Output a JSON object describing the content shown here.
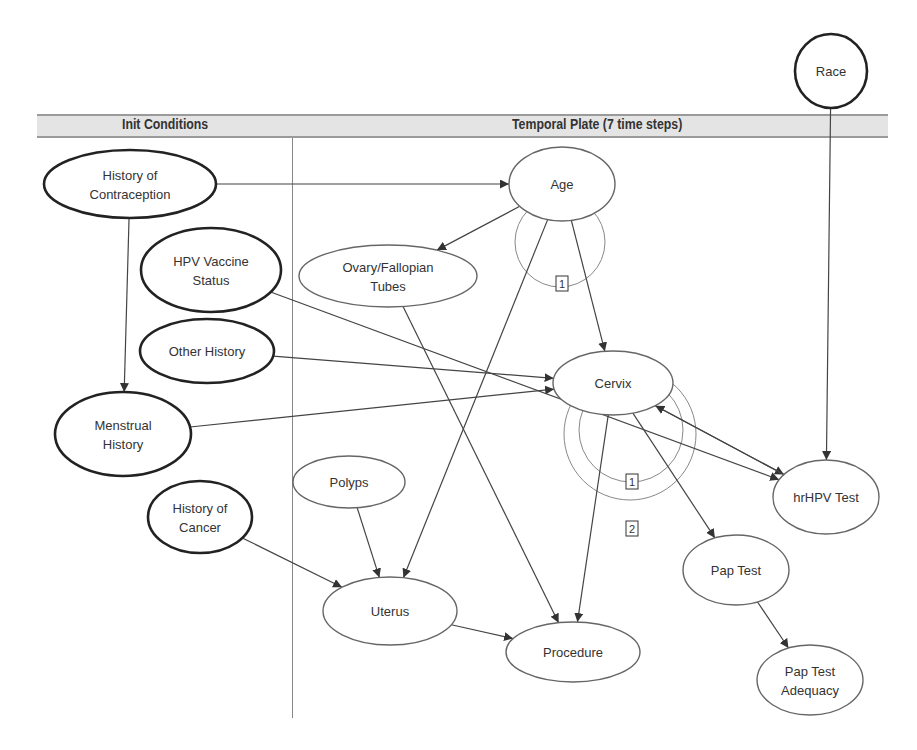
{
  "plate": {
    "init_label": "Init Conditions",
    "temporal_label": "Temporal Plate (7 time steps)"
  },
  "colors": {
    "edge": "#444444",
    "loop_edge": "#888888",
    "node_stroke_init": "#222222",
    "node_stroke_temporal": "#666666",
    "header_fill": "#e4e4e4"
  },
  "nodes": [
    {
      "id": "race",
      "lines": [
        "Race"
      ],
      "cx": 831,
      "cy": 71,
      "rx": 36,
      "ry": 37,
      "bold": true
    },
    {
      "id": "history-of-contraception",
      "lines": [
        "History of",
        "Contraception"
      ],
      "cx": 130,
      "cy": 184,
      "rx": 86,
      "ry": 34,
      "bold": true
    },
    {
      "id": "hpv-vaccine-status",
      "lines": [
        "HPV Vaccine",
        "Status"
      ],
      "cx": 211,
      "cy": 270,
      "rx": 70,
      "ry": 42,
      "bold": true
    },
    {
      "id": "other-history",
      "lines": [
        "Other History"
      ],
      "cx": 207,
      "cy": 351,
      "rx": 67,
      "ry": 32,
      "bold": true
    },
    {
      "id": "menstrual-history",
      "lines": [
        "Menstrual",
        "History"
      ],
      "cx": 123,
      "cy": 434,
      "rx": 68,
      "ry": 42,
      "bold": true
    },
    {
      "id": "history-of-cancer",
      "lines": [
        "History of",
        "Cancer"
      ],
      "cx": 200,
      "cy": 517,
      "rx": 52,
      "ry": 36,
      "bold": true
    },
    {
      "id": "age",
      "lines": [
        "Age"
      ],
      "cx": 562,
      "cy": 184,
      "rx": 53,
      "ry": 37,
      "bold": false
    },
    {
      "id": "ovary-fallopian-tubes",
      "lines": [
        "Ovary/Fallopian",
        "Tubes"
      ],
      "cx": 388,
      "cy": 276,
      "rx": 89,
      "ry": 31,
      "bold": false
    },
    {
      "id": "cervix",
      "lines": [
        "Cervix"
      ],
      "cx": 613,
      "cy": 383,
      "rx": 60,
      "ry": 32,
      "bold": false
    },
    {
      "id": "polyps",
      "lines": [
        "Polyps"
      ],
      "cx": 349,
      "cy": 482,
      "rx": 56,
      "ry": 26,
      "bold": false
    },
    {
      "id": "hrhpv-test",
      "lines": [
        "hrHPV Test"
      ],
      "cx": 826,
      "cy": 497,
      "rx": 53,
      "ry": 37,
      "bold": false
    },
    {
      "id": "pap-test",
      "lines": [
        "Pap Test"
      ],
      "cx": 736,
      "cy": 570,
      "rx": 53,
      "ry": 35,
      "bold": false
    },
    {
      "id": "uterus",
      "lines": [
        "Uterus"
      ],
      "cx": 390,
      "cy": 611,
      "rx": 67,
      "ry": 34,
      "bold": false
    },
    {
      "id": "procedure",
      "lines": [
        "Procedure"
      ],
      "cx": 573,
      "cy": 652,
      "rx": 67,
      "ry": 30,
      "bold": false
    },
    {
      "id": "pap-test-adequacy",
      "lines": [
        "Pap Test",
        "Adequacy"
      ],
      "cx": 810,
      "cy": 680,
      "rx": 53,
      "ry": 35,
      "bold": false
    }
  ],
  "edges": [
    {
      "from": "race",
      "to": "hrhpv-test"
    },
    {
      "from": "history-of-contraception",
      "to": "age"
    },
    {
      "from": "history-of-contraception",
      "to": "menstrual-history"
    },
    {
      "from": "hpv-vaccine-status",
      "to": "hrhpv-test"
    },
    {
      "from": "other-history",
      "to": "cervix"
    },
    {
      "from": "menstrual-history",
      "to": "cervix"
    },
    {
      "from": "history-of-cancer",
      "to": "uterus"
    },
    {
      "from": "age",
      "to": "ovary-fallopian-tubes"
    },
    {
      "from": "age",
      "to": "cervix"
    },
    {
      "from": "age",
      "to": "uterus"
    },
    {
      "from": "ovary-fallopian-tubes",
      "to": "procedure"
    },
    {
      "from": "cervix",
      "to": "procedure"
    },
    {
      "from": "cervix",
      "to": "pap-test"
    },
    {
      "from": "cervix",
      "to": "hrhpv-test"
    },
    {
      "from": "hrhpv-test",
      "to": "cervix"
    },
    {
      "from": "polyps",
      "to": "uterus"
    },
    {
      "from": "uterus",
      "to": "procedure"
    },
    {
      "from": "pap-test",
      "to": "pap-test-adequacy"
    }
  ],
  "temporal_loops": [
    {
      "node": "age",
      "order": "1",
      "cx": 560,
      "cy": 242,
      "r": 45,
      "label_x": 562,
      "label_y": 284
    },
    {
      "node": "cervix",
      "order": "1",
      "cx": 631,
      "cy": 430,
      "r": 52,
      "label_x": 632,
      "label_y": 482
    },
    {
      "node": "cervix",
      "order": "2",
      "cx": 630,
      "cy": 434,
      "r": 66,
      "label_x": 632,
      "label_y": 529
    }
  ]
}
